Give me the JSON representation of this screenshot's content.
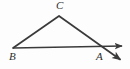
{
  "figure": {
    "background_color": "#fdfdfd",
    "stroke_color": "#3a3a3a",
    "label_color": "#2e2e2e",
    "stroke_width": 1.6,
    "labels": {
      "A": "A",
      "B": "B",
      "C": "C"
    },
    "points": {
      "A": {
        "x": 103,
        "y": 47
      },
      "B": {
        "x": 13,
        "y": 48
      },
      "C": {
        "x": 59,
        "y": 16
      }
    },
    "label_positions": {
      "A": {
        "x": 96,
        "y": 51
      },
      "B": {
        "x": 9,
        "y": 51
      },
      "C": {
        "x": 56,
        "y": 0
      }
    },
    "segments": [
      {
        "name": "segment-BC",
        "from": "B",
        "to": "C",
        "x1": 13,
        "y1": 48,
        "x2": 59,
        "y2": 16,
        "arrow": "none"
      },
      {
        "name": "ray-B-through-A",
        "from": "B",
        "to": "arrow-right",
        "x1": 13,
        "y1": 48,
        "x2": 127,
        "y2": 46,
        "arrow": "end"
      },
      {
        "name": "ray-C-through-A",
        "from": "C",
        "to": "arrow-down-right",
        "x1": 59,
        "y1": 16,
        "x2": 125,
        "y2": 63,
        "arrow": "end"
      }
    ],
    "arrowheads": [
      {
        "name": "arrowhead-horizontal-right",
        "tip_x": 127,
        "tip_y": 46
      },
      {
        "name": "arrowhead-transversal-down-right",
        "tip_x": 125,
        "tip_y": 63
      }
    ]
  }
}
